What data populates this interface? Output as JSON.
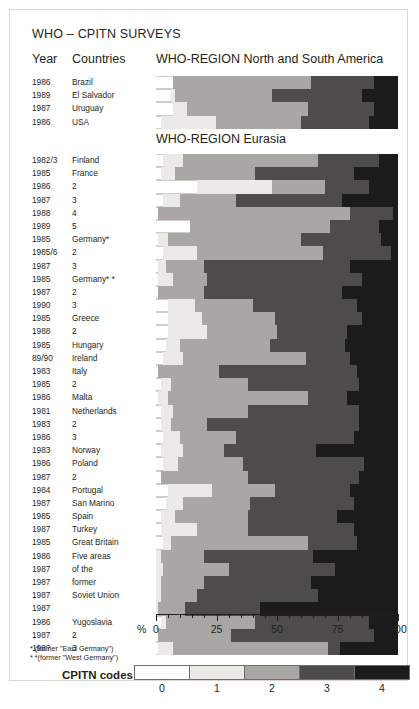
{
  "title": "WHO – CPITN SURVEYS",
  "headers": {
    "year": "Year",
    "countries": "Countries",
    "america": "WHO-REGION North and South America",
    "eurasia": "WHO-REGION Eurasia"
  },
  "axis": {
    "pct_symbol": "%",
    "ticks": [
      0,
      25,
      50,
      75,
      100
    ],
    "min": 0,
    "max": 100
  },
  "footnotes": [
    "*  (former \"East Germany\")",
    "* *(former \"West Germany\")"
  ],
  "legend": {
    "title": "CPITN codes",
    "codes": [
      "0",
      "1",
      "2",
      "3",
      "4"
    ],
    "colors": {
      "0": "#ffffff",
      "1": "#eceae6",
      "2": "#a9a7a4",
      "3": "#4d4c4b",
      "4": "#1b1b1b"
    }
  },
  "chart_data": {
    "type": "bar",
    "orientation": "horizontal",
    "stacked": true,
    "title": "WHO – CPITN SURVEYS",
    "xlabel": "%",
    "ylabel": "",
    "xlim": [
      0,
      100
    ],
    "grid": false,
    "legend_position": "bottom",
    "series": [
      "0",
      "1",
      "2",
      "3",
      "4"
    ],
    "panels": [
      {
        "name": "WHO-REGION North and South America",
        "rows": [
          {
            "year": "1986",
            "country": "Brazil",
            "values": [
              7,
              0,
              57,
              26,
              10
            ]
          },
          {
            "year": "1989",
            "country": "El Salvador",
            "values": [
              6,
              2,
              40,
              37,
              15
            ]
          },
          {
            "year": "1987",
            "country": "Uruguay",
            "values": [
              7,
              6,
              50,
              27,
              10
            ]
          },
          {
            "year": "1986",
            "country": "USA",
            "values": [
              2,
              23,
              35,
              28,
              12
            ]
          }
        ]
      },
      {
        "name": "WHO-REGION Eurasia",
        "rows": [
          {
            "year": "1982/3",
            "country": "Finland",
            "values": [
              3,
              8,
              56,
              25,
              8
            ]
          },
          {
            "year": "1985",
            "country": "France",
            "values": [
              2,
              6,
              33,
              41,
              18
            ]
          },
          {
            "year": "1986",
            "country": "2",
            "values": [
              17,
              31,
              22,
              18,
              12
            ]
          },
          {
            "year": "1987",
            "country": "3",
            "values": [
              3,
              7,
              23,
              44,
              23
            ]
          },
          {
            "year": "1988",
            "country": "4",
            "values": [
              1,
              0,
              79,
              18,
              2
            ]
          },
          {
            "year": "1989",
            "country": "5",
            "values": [
              14,
              0,
              58,
              20,
              8
            ]
          },
          {
            "year": "1985",
            "country": "Germany*",
            "values": [
              1,
              4,
              55,
              33,
              7
            ]
          },
          {
            "year": "1985/6",
            "country": "2",
            "values": [
              3,
              14,
              52,
              28,
              3
            ]
          },
          {
            "year": "1987",
            "country": "3",
            "values": [
              1,
              3,
              16,
              60,
              20
            ]
          },
          {
            "year": "1985",
            "country": "Germany* *",
            "values": [
              1,
              6,
              14,
              64,
              15
            ]
          },
          {
            "year": "1987",
            "country": "2",
            "values": [
              1,
              0,
              19,
              57,
              23
            ]
          },
          {
            "year": "1990",
            "country": "3",
            "values": [
              5,
              11,
              24,
              43,
              17
            ]
          },
          {
            "year": "1985",
            "country": "Greece",
            "values": [
              5,
              14,
              30,
              36,
              15
            ]
          },
          {
            "year": "1988",
            "country": "2",
            "values": [
              5,
              16,
              29,
              29,
              21
            ]
          },
          {
            "year": "1985",
            "country": "Hungary",
            "values": [
              4,
              6,
              37,
              31,
              22
            ]
          },
          {
            "year": "89/90",
            "country": "Ireland",
            "values": [
              3,
              8,
              51,
              18,
              20
            ]
          },
          {
            "year": "1983",
            "country": "Italy",
            "values": [
              1,
              0,
              25,
              57,
              17
            ]
          },
          {
            "year": "1985",
            "country": "2",
            "values": [
              2,
              4,
              32,
              46,
              16
            ]
          },
          {
            "year": "1986",
            "country": "Malta",
            "values": [
              1,
              4,
              58,
              16,
              21
            ]
          },
          {
            "year": "1981",
            "country": "Netherlands",
            "values": [
              2,
              5,
              31,
              46,
              16
            ]
          },
          {
            "year": "1983",
            "country": "2",
            "values": [
              2,
              4,
              15,
              63,
              16
            ]
          },
          {
            "year": "1986",
            "country": "3",
            "values": [
              3,
              7,
              23,
              49,
              18
            ]
          },
          {
            "year": "1983",
            "country": "Norway",
            "values": [
              2,
              9,
              17,
              38,
              34
            ]
          },
          {
            "year": "1986",
            "country": "Poland",
            "values": [
              3,
              6,
              27,
              50,
              14
            ]
          },
          {
            "year": "1987",
            "country": "2",
            "values": [
              2,
              0,
              36,
              46,
              16
            ]
          },
          {
            "year": "1984",
            "country": "Portugal",
            "values": [
              5,
              18,
              26,
              31,
              20
            ]
          },
          {
            "year": "1987",
            "country": "San Marino",
            "values": [
              4,
              7,
              28,
              43,
              18
            ]
          },
          {
            "year": "1985",
            "country": "Spain",
            "values": [
              2,
              6,
              30,
              37,
              25
            ]
          },
          {
            "year": "1987",
            "country": "Turkey",
            "values": [
              2,
              15,
              21,
              44,
              18
            ]
          },
          {
            "year": "1985",
            "country": "Great Britain",
            "values": [
              3,
              3,
              57,
              20,
              17
            ]
          },
          {
            "year": "1986",
            "country": "Five areas",
            "values": [
              0,
              2,
              18,
              45,
              35
            ]
          },
          {
            "year": "1987",
            "country": "of the",
            "values": [
              0,
              3,
              27,
              44,
              26
            ]
          },
          {
            "year": "1987",
            "country": "former",
            "values": [
              0,
              2,
              18,
              44,
              36
            ]
          },
          {
            "year": "1987",
            "country": "Soviet Union",
            "values": [
              0,
              2,
              15,
              50,
              33
            ]
          },
          {
            "year": "1987",
            "country": "",
            "values": [
              0,
              1,
              11,
              31,
              57
            ]
          },
          {
            "year": "1986",
            "country": "Yugoslavia",
            "values": [
              2,
              2,
              37,
              47,
              12
            ]
          },
          {
            "year": "1987",
            "country": "2",
            "values": [
              1,
              0,
              30,
              59,
              10
            ]
          },
          {
            "year": "198?",
            "country": "3",
            "values": [
              1,
              6,
              64,
              5,
              24
            ]
          }
        ]
      }
    ]
  }
}
